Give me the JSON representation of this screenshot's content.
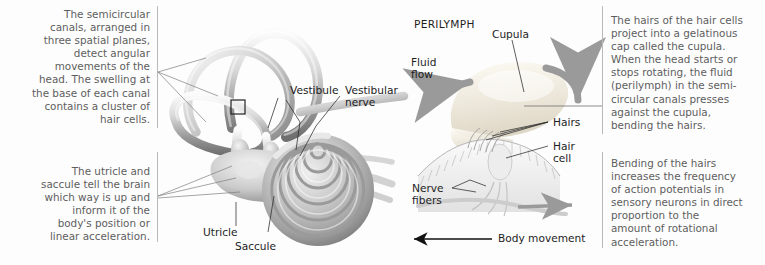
{
  "figure": {
    "background_color": "#fdfdfd",
    "text_color_caption": "#5d5d5d",
    "text_color_label": "#1d1d1d",
    "rule_color": "#b9b9b9",
    "arrow_color_body_movement": "#111111",
    "arrow_color_fluid_flow": "#8e8e8e"
  },
  "captions": {
    "top_left": "The semicircular\ncanals, arranged in\nthree spatial planes,\ndetect angular\nmovements of the\nhead. The swelling at\nthe base of each canal\ncontains a cluster of\nhair cells.",
    "bottom_left": "The utricle and\nsaccule tell the brain\nwhich way is up and\ninform it of the\nbody's position or\nlinear acceleration.",
    "top_right": "The hairs of the hair cells\nproject into a gelatinous\ncap called the cupula.\nWhen the head starts or\nstops rotating, the fluid\n(perilymph) in the semi-\ncircular canals presses\nagainst the cupula,\nbending the hairs.",
    "bottom_right": "Bending of the hairs\nincreases the frequency\nof action potentials in\nsensory neurons in direct\nproportion to the\namount of rotational\nacceleration."
  },
  "labels": {
    "vestibule": "Vestibule",
    "vestibular_nerve": "Vestibular\nnerve",
    "utricle": "Utricle",
    "saccule": "Saccule",
    "perilymph": "PERILYMPH",
    "cupula": "Cupula",
    "fluid_flow": "Fluid\nflow",
    "hairs": "Hairs",
    "hair_cell": "Hair\ncell",
    "nerve_fibers": "Nerve\nfibers",
    "body_movement": "Body movement"
  }
}
